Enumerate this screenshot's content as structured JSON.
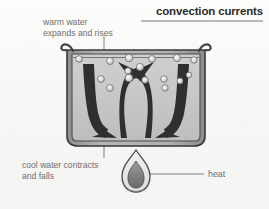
{
  "title": {
    "text": "convection currents"
  },
  "labels": {
    "warm": "warm water\nexpands and rises",
    "cool": "cool water contracts\nand falls",
    "heat": "heat"
  },
  "diagram": {
    "name": "convection-currents-in-heated-pot",
    "vessel": "pot of water with curved rim spouts",
    "arrows": [
      {
        "name": "left-convection-arrow",
        "direction": "up-and-outward-then-down-left"
      },
      {
        "name": "right-convection-arrow",
        "direction": "up-and-outward-then-down-right"
      }
    ],
    "bubble_count": 14,
    "heat_source": "flame"
  },
  "colors": {
    "page_background": "#faf9f7",
    "title_text": "#2e2e2e",
    "title_rule": "#b9b9b9",
    "label_text": "#6e6e6e",
    "leader_line": "#8a8a8a",
    "pot_outline": "#3a3a3a",
    "pot_wall": "#9a9a9a",
    "water_fill": "#c6c6c6",
    "arrow_fill": "#2f2f2f",
    "bubble_fill": "#d8d8d8",
    "bubble_outline": "#6f6f6f",
    "flame_outer": "#e3e3e1",
    "flame_inner": "#7a7a7a",
    "flame_outline": "#4a4a4a"
  }
}
